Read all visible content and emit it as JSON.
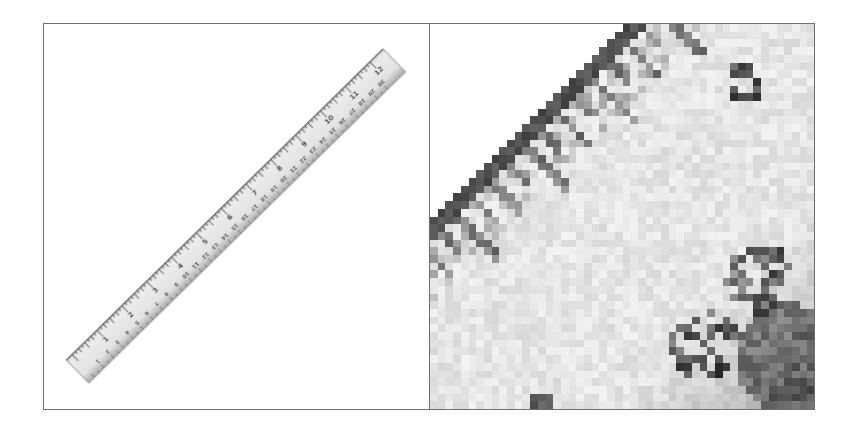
{
  "figure": {
    "layout": "two-panel comparison",
    "left_panel": {
      "subject": "ruler",
      "description": "Full view of a diagonal 12-inch ruler with inch and centimeter scales",
      "inch_labels": [
        "1",
        "2",
        "3",
        "4",
        "5",
        "6",
        "7",
        "8",
        "9",
        "10",
        "11",
        "12"
      ],
      "cm_labels": [
        "1",
        "2",
        "3",
        "4",
        "5",
        "6",
        "7",
        "8",
        "9",
        "10",
        "11",
        "12",
        "13",
        "14",
        "15",
        "16",
        "17",
        "18",
        "19",
        "20",
        "21",
        "22",
        "23",
        "24",
        "25",
        "26",
        "27",
        "28",
        "29",
        "30"
      ]
    },
    "right_panel": {
      "subject": "ruler-closeup",
      "description": "Pixelated magnified crop of the ruler near the 2-inch mark",
      "visible_labels": [
        "2",
        "5",
        "6"
      ]
    }
  },
  "colors": {
    "border": "#6e6e6e",
    "ruler_face": "#e4e4e4",
    "ruler_edge": "#3a3a3a",
    "ticks": "#555555",
    "background": "#ffffff"
  }
}
